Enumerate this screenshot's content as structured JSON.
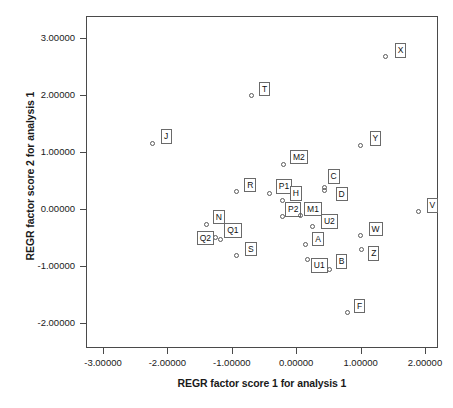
{
  "chart_data": {
    "type": "scatter",
    "title": "",
    "xlabel": "REGR factor score 1 for analysis 1",
    "ylabel": "REGR factor score 2 for analysis 1",
    "xlim": [
      -3.3,
      2.2
    ],
    "ylim": [
      -2.3,
      3.2
    ],
    "grid": false,
    "legend": "none",
    "xticks": [
      "-3.00000",
      "-2.00000",
      "-1.00000",
      "0.00000",
      "1.00000",
      "2.00000"
    ],
    "xtick_values": [
      -3,
      -2,
      -1,
      0,
      1,
      2
    ],
    "yticks": [
      "3.00000",
      "2.00000",
      "1.00000",
      "0.00000",
      "-1.00000",
      "-2.00000"
    ],
    "ytick_values": [
      3,
      2,
      1,
      0,
      -1,
      -2
    ],
    "points": [
      {
        "label": "X",
        "x": 1.39,
        "y": 2.68,
        "lx": 9,
        "ly": -13
      },
      {
        "label": "T",
        "x": -0.7,
        "y": 1.99,
        "lx": 8,
        "ly": -14
      },
      {
        "label": "J",
        "x": -2.23,
        "y": 1.15,
        "lx": 8,
        "ly": -14
      },
      {
        "label": "Y",
        "x": 1.0,
        "y": 1.12,
        "lx": 9,
        "ly": -14
      },
      {
        "label": "M2",
        "x": -0.19,
        "y": 0.78,
        "lx": 6,
        "ly": -15
      },
      {
        "label": "R",
        "x": -0.93,
        "y": 0.3,
        "lx": 8,
        "ly": -14
      },
      {
        "label": "P1",
        "x": -0.41,
        "y": 0.28,
        "lx": 6,
        "ly": -14
      },
      {
        "label": "C",
        "x": 0.44,
        "y": 0.38,
        "lx": 3,
        "ly": -18
      },
      {
        "label": "H",
        "x": -0.21,
        "y": 0.15,
        "lx": 7,
        "ly": -14
      },
      {
        "label": "D",
        "x": 0.44,
        "y": 0.32,
        "lx": 11,
        "ly": -4
      },
      {
        "label": "V",
        "x": 1.9,
        "y": -0.04,
        "lx": 8,
        "ly": -13
      },
      {
        "label": "P2",
        "x": -0.22,
        "y": -0.13,
        "lx": 3,
        "ly": -14
      },
      {
        "label": "M1",
        "x": 0.06,
        "y": -0.12,
        "lx": 4,
        "ly": -14
      },
      {
        "label": "U2",
        "x": 0.26,
        "y": -0.3,
        "lx": 8,
        "ly": -12
      },
      {
        "label": "N",
        "x": -1.39,
        "y": -0.28,
        "lx": 6,
        "ly": -15
      },
      {
        "label": "Q1",
        "x": -1.18,
        "y": -0.53,
        "lx": 4,
        "ly": -16
      },
      {
        "label": "Q2",
        "x": -1.25,
        "y": -0.5,
        "lx": -19,
        "ly": -7
      },
      {
        "label": "W",
        "x": 1.0,
        "y": -0.47,
        "lx": 8,
        "ly": -14
      },
      {
        "label": "A",
        "x": 0.14,
        "y": -0.63,
        "lx": 7,
        "ly": -13
      },
      {
        "label": "S",
        "x": -0.92,
        "y": -0.82,
        "lx": 8,
        "ly": -14
      },
      {
        "label": "Z",
        "x": 1.01,
        "y": -0.71,
        "lx": 7,
        "ly": -3
      },
      {
        "label": "B",
        "x": 0.52,
        "y": -1.06,
        "lx": 6,
        "ly": -15
      },
      {
        "label": "U1",
        "x": 0.18,
        "y": -0.88,
        "lx": 3,
        "ly": -1
      },
      {
        "label": "F",
        "x": 0.79,
        "y": -1.82,
        "lx": 7,
        "ly": -14
      }
    ]
  }
}
